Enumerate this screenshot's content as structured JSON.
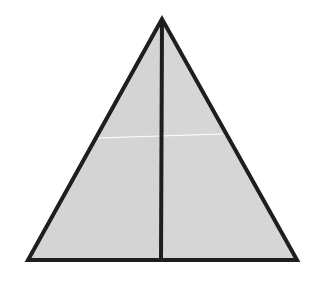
{
  "diagram": {
    "type": "triangle-divided",
    "shape": "isosceles-triangle",
    "fill_color": "#d4d4d4",
    "stroke_color": "#1e1e1e",
    "background_color": "#ffffff",
    "vertices": {
      "apex": [
        162,
        19
      ],
      "base_left": [
        28,
        260
      ],
      "base_right": [
        297,
        260
      ]
    },
    "median_line": {
      "from": [
        162,
        19
      ],
      "to": [
        161,
        260
      ],
      "color": "#1e1e1e"
    },
    "faint_horizontal_line": {
      "from": [
        98,
        138
      ],
      "to": [
        222,
        134
      ],
      "color": "#ffffff"
    },
    "regions": [
      "left-half",
      "right-half"
    ]
  }
}
